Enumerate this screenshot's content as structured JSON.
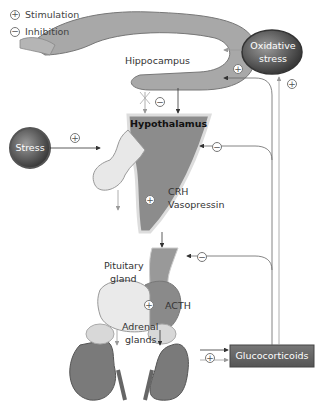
{
  "legend": {
    "stimulation": {
      "symbol": "+",
      "label": "Stimulation"
    },
    "inhibition": {
      "symbol": "−",
      "label": "Inhibition"
    }
  },
  "nodes": {
    "hippocampus": "Hippocampus",
    "hypothalamus": "Hypothalamus",
    "stress": "Stress",
    "oxidative_stress_line1": "Oxidative",
    "oxidative_stress_line2": "stress",
    "crh": "CRH",
    "vasopressin": "Vasopressin",
    "pituitary_line1": "Pituitary",
    "pituitary_line2": "gland",
    "acth": "ACTH",
    "adrenal_line1": "Adrenal",
    "adrenal_line2": "glands",
    "glucocorticoids": "Glucocorticoids"
  },
  "signs": {
    "plus": "+",
    "minus": "−"
  },
  "colors": {
    "organ_gray": "#8c8c8c",
    "dark_gray": "#6f6f6f",
    "light_tissue": "#e6e6e6",
    "kidney": "#7a7a7a",
    "line": "#666666",
    "box_dark": "#555555"
  }
}
